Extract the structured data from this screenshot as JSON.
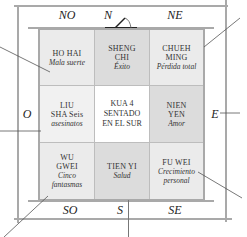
{
  "directions": {
    "north": "N",
    "northwest": "NO",
    "northeast": "NE",
    "west": "O",
    "east": "E",
    "south": "S",
    "southwest": "SO",
    "southeast": "SE"
  },
  "grid": {
    "cells": [
      {
        "position": "NO",
        "name": "HO HAI",
        "meaning": "Mala suerte",
        "shade": "#ebebeb"
      },
      {
        "position": "N",
        "name": "SHENG CHI",
        "meaning": "Éxito",
        "shade": "#dcdcdc"
      },
      {
        "position": "NE",
        "name": "CHUEH MING",
        "meaning": "Pérdida total",
        "shade": "#ebebeb"
      },
      {
        "position": "O",
        "name": "LIU SHA",
        "meaning": "Seis asesinatos",
        "shade": "#f1f1f1"
      },
      {
        "position": "center",
        "name": "KUA 4 SENTADO EN EL SUR",
        "meaning": "",
        "shade": "#ffffff"
      },
      {
        "position": "E",
        "name": "NIEN YEN",
        "meaning": "Amor",
        "shade": "#dcdcdc"
      },
      {
        "position": "SO",
        "name": "WU GWEI",
        "meaning": "Cinco fantasmas",
        "shade": "#ebebeb"
      },
      {
        "position": "S",
        "name": "TIEN YI",
        "meaning": "Salud",
        "shade": "#dcdcdc"
      },
      {
        "position": "SE",
        "name": "FU WEI",
        "meaning": "Crecimiento personal",
        "shade": "#ebebeb"
      }
    ],
    "liu_sha_lines": [
      "LIU",
      "SHA Seis",
      "asesinatos"
    ],
    "center_lines": [
      "KUA 4",
      "SENTADO",
      "EN EL SUR"
    ],
    "sheng_chi_lines": [
      "SHENG",
      "CHI"
    ],
    "chueh_ming_lines": [
      "CHUEH",
      "MING"
    ],
    "wu_gwei_lines": [
      "WU",
      "GWEI"
    ],
    "nien_yen_lines": [
      "NIEN",
      "YEN"
    ],
    "fu_wei_meaning_lines": [
      "Crecimiento",
      "personal"
    ]
  },
  "colors": {
    "frame": "#a9a9a9",
    "leader_line": "#555555",
    "text": "#2a2a2a"
  }
}
